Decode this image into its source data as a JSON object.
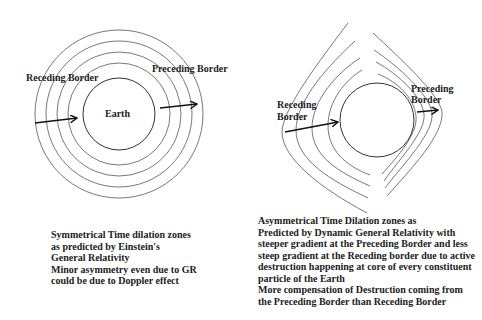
{
  "left_diagram": {
    "earth_label": "Earth",
    "receding_label": "Receding Border",
    "preceding_label": "Preceding Border",
    "caption": {
      "lines": [
        "Symmetrical Time dilation zones",
        "as predicted by Einstein's",
        "General Relativity"
      ],
      "note_lines": [
        "Minor asymmetry even due to GR",
        "could be due to Doppler effect"
      ]
    }
  },
  "right_diagram": {
    "receding_label_line1": "Receding",
    "receding_label_line2": "Border",
    "preceding_label_line1": "Preceding",
    "preceding_label_line2": "Border",
    "caption": {
      "lines": [
        "Asymmetrical Time Dilation zones as",
        "Predicted by Dynamic General Relativity with",
        "steeper gradient at the Preceding Border and less",
        "steep gradient at the Receding border due to active",
        "destruction happening at core of every constituent",
        "particle of the Earth",
        "More compensation of Destruction coming from",
        "the Preceding Border than Receding Border"
      ]
    }
  }
}
